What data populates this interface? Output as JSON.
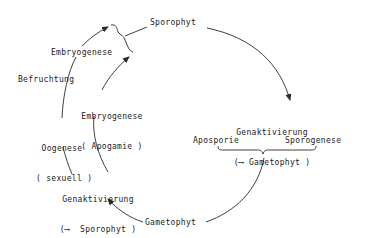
{
  "diagram": {
    "nodes": {
      "sporophyt": "Sporophyt",
      "gametophyt": "Gametophyt"
    },
    "left_cycle": {
      "embryogenese": "Embryogenese",
      "befruchtung": "Befruchtung",
      "embryogenese_apogamie_line1": "Embryogenese",
      "embryogenese_apogamie_line2": "( Apogamie )",
      "oogenese_line1": "Oogenese",
      "oogenese_line2": "( sexuell )",
      "genaktivierung_line1": "Genaktivierung",
      "genaktivierung_line2": "(⟶  Sporophyt )"
    },
    "right_cycle": {
      "genaktivierung_line1": "Genaktivierung",
      "genaktivierung_line2": "(⟶ Gametophyt )",
      "aposporie": "Aposporie",
      "sporogenese": "Sporogenese"
    },
    "line_color": "#2a2a2a"
  }
}
